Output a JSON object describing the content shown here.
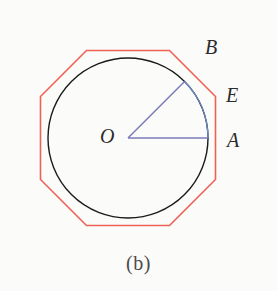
{
  "figure": {
    "caption": "(b)",
    "background_color": "#fbfbfa",
    "width": 277,
    "height": 291
  },
  "geometry": {
    "center": {
      "x": 128,
      "y": 138,
      "label": "O"
    },
    "circle": {
      "radius": 80,
      "stroke_color": "#1a1a1a",
      "stroke_width": 1.4,
      "fill": "none"
    },
    "octagon": {
      "sides": 8,
      "circumradius": 87.5,
      "inradius": 80.8,
      "rotation_deg": 22.5,
      "stroke_color": "#ef6155",
      "stroke_width": 1.6,
      "fill": "none",
      "position": "circumscribed"
    },
    "radii": [
      {
        "name": "OA",
        "from": "O",
        "to": "A",
        "angle_deg": 0,
        "stroke_color": "#7b7bb8"
      },
      {
        "name": "OB",
        "from": "O",
        "to": "B",
        "angle_deg": 45,
        "stroke_color": "#7b7bb8"
      }
    ],
    "arc": {
      "name": "arc-AB",
      "from": "A",
      "to": "B",
      "stroke_color": "#6f8fd0",
      "stroke_width": 1.2
    },
    "points": [
      {
        "label": "A",
        "x": 208,
        "y": 138,
        "on": "circle",
        "angle_deg": 0
      },
      {
        "label": "B",
        "x": 185,
        "y": 82,
        "on": "circle",
        "angle_deg": 45
      },
      {
        "label": "E",
        "x": 216,
        "y": 105,
        "on": "octagon-edge"
      },
      {
        "label": "O",
        "x": 128,
        "y": 138,
        "on": "center"
      }
    ]
  },
  "labels": {
    "O": "O",
    "A": "A",
    "B": "B",
    "E": "E"
  },
  "colors": {
    "circle": "#1a1a1a",
    "octagon": "#ef6155",
    "radius": "#7b7bb8",
    "arc": "#6f8fd0",
    "label_text": "#2b2b2b",
    "caption_text": "#4a4a4a"
  }
}
